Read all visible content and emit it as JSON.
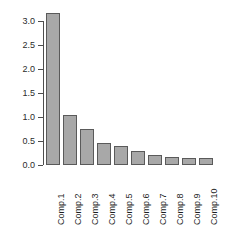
{
  "chart_data": {
    "type": "bar",
    "title": "",
    "subtitle": "",
    "xlabel": "",
    "ylabel": "",
    "categories": [
      "Comp.1",
      "Comp.2",
      "Comp.3",
      "Comp.4",
      "Comp.5",
      "Comp.6",
      "Comp.7",
      "Comp.8",
      "Comp.9",
      "Comp.10"
    ],
    "values": [
      3.17,
      1.04,
      0.76,
      0.46,
      0.39,
      0.3,
      0.21,
      0.17,
      0.15,
      0.14
    ],
    "ylim": [
      0.0,
      3.0
    ],
    "yticks": [
      0.0,
      0.5,
      1.0,
      1.5,
      2.0,
      2.5,
      3.0
    ],
    "ytick_labels": [
      "0.0",
      "0.5",
      "1.0",
      "1.5",
      "2.0",
      "2.5",
      "3.0"
    ],
    "xtick_labels_rotation": 90,
    "grid": false,
    "legend": false,
    "bar_fill_color": "#a8a8a8",
    "bar_border_color": "#5a5a5a",
    "axis_color": "#4d4d4d",
    "background_color": "#ffffff"
  }
}
